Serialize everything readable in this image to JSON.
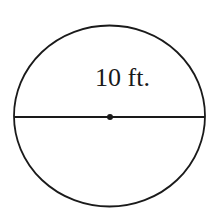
{
  "diagram": {
    "type": "circle-with-diameter",
    "shape": "circle",
    "diameter_label": "10 ft.",
    "measurement": {
      "value": 10,
      "unit": "ft."
    },
    "center_point": true,
    "colors": {
      "stroke": "#1a1a1a",
      "background": "#ffffff"
    }
  }
}
